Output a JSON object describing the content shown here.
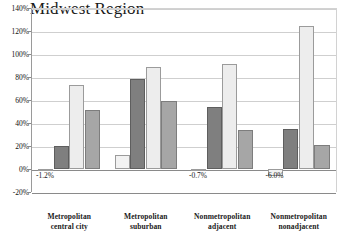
{
  "chart_data": {
    "type": "bar",
    "title": "Midwest Region",
    "xlabel": "",
    "ylabel": "",
    "ylim": [
      -20,
      140
    ],
    "ytick_step": 20,
    "grid": true,
    "legend": null,
    "legend_position": "none",
    "categories": [
      "Metropolitan central city",
      "Metropolitan suburban",
      "Nonmetropolitan adjacent",
      "Nonmetropolitan nonadjacent"
    ],
    "category_lines": [
      [
        "Metropolitan",
        "central city"
      ],
      [
        "Metropolitan",
        "suburban"
      ],
      [
        "Nonmetropolitan",
        "adjacent"
      ],
      [
        "Nonmetropolitan",
        "nonadjacent"
      ]
    ],
    "series": [
      {
        "name": "Series 1",
        "color": "#f2f2f2",
        "values": [
          -1.2,
          12,
          -0.7,
          -6.0
        ]
      },
      {
        "name": "Series 2",
        "color": "#7f7f7f",
        "values": [
          20,
          78,
          54,
          35
        ]
      },
      {
        "name": "Series 3",
        "color": "#ededed",
        "values": [
          73,
          89,
          91,
          124
        ]
      },
      {
        "name": "Series 4",
        "color": "#a6a6a6",
        "values": [
          51,
          59,
          34,
          21
        ]
      }
    ],
    "ytick_labels": [
      "140%",
      "120%",
      "100%",
      "80%",
      "60%",
      "40%",
      "20%",
      "0%",
      "-20%"
    ],
    "ytick_values": [
      140,
      120,
      100,
      80,
      60,
      40,
      20,
      0,
      -20
    ],
    "annotations": [
      {
        "text": "-1.2%",
        "category_index": 0,
        "series_index": 0
      },
      {
        "text": "-0.7%",
        "category_index": 2,
        "series_index": 0
      },
      {
        "text": "-6.0%",
        "category_index": 3,
        "series_index": 0
      }
    ]
  }
}
